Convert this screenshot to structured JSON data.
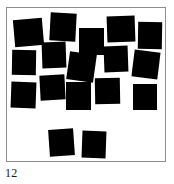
{
  "figure": {
    "caption": "12",
    "frame": {
      "border_color": "#8d8d8d",
      "background_color": "#ffffff",
      "x": 6,
      "y": 7,
      "width": 160,
      "height": 155
    },
    "stimulus": {
      "shape": "square",
      "fill_color": "#000000",
      "count": 17,
      "description": "scattered black squares on white field"
    }
  },
  "chart_data": {
    "type": "scatter",
    "title": "12",
    "xlabel": "",
    "ylabel": "",
    "xlim": [
      0,
      160
    ],
    "ylim": [
      0,
      155
    ],
    "grid": false,
    "legend": "none",
    "marker": "square",
    "marker_color": "#000000",
    "count": 17,
    "squares": [
      {
        "id": 1,
        "x": 7,
        "y": 11,
        "w": 29,
        "h": 27,
        "rot": -5
      },
      {
        "id": 2,
        "x": 43,
        "y": 5,
        "w": 26,
        "h": 28,
        "rot": 3
      },
      {
        "id": 3,
        "x": 72,
        "y": 20,
        "w": 25,
        "h": 27,
        "rot": 0
      },
      {
        "id": 4,
        "x": 100,
        "y": 8,
        "w": 28,
        "h": 26,
        "rot": -2
      },
      {
        "id": 5,
        "x": 131,
        "y": 14,
        "w": 24,
        "h": 27,
        "rot": 1
      },
      {
        "id": 6,
        "x": 35,
        "y": 34,
        "w": 24,
        "h": 26,
        "rot": -2
      },
      {
        "id": 7,
        "x": 5,
        "y": 42,
        "w": 24,
        "h": 25,
        "rot": 1
      },
      {
        "id": 8,
        "x": 61,
        "y": 45,
        "w": 27,
        "h": 28,
        "rot": 8
      },
      {
        "id": 9,
        "x": 97,
        "y": 38,
        "w": 24,
        "h": 26,
        "rot": -2
      },
      {
        "id": 10,
        "x": 126,
        "y": 43,
        "w": 26,
        "h": 27,
        "rot": 7
      },
      {
        "id": 11,
        "x": 33,
        "y": 67,
        "w": 25,
        "h": 25,
        "rot": -3
      },
      {
        "id": 12,
        "x": 4,
        "y": 74,
        "w": 25,
        "h": 26,
        "rot": 2
      },
      {
        "id": 13,
        "x": 59,
        "y": 74,
        "w": 25,
        "h": 28,
        "rot": 0
      },
      {
        "id": 14,
        "x": 88,
        "y": 70,
        "w": 25,
        "h": 26,
        "rot": -1
      },
      {
        "id": 15,
        "x": 126,
        "y": 76,
        "w": 24,
        "h": 26,
        "rot": 0
      },
      {
        "id": 16,
        "x": 42,
        "y": 121,
        "w": 25,
        "h": 27,
        "rot": -4
      },
      {
        "id": 17,
        "x": 75,
        "y": 123,
        "w": 24,
        "h": 27,
        "rot": 2
      }
    ]
  }
}
